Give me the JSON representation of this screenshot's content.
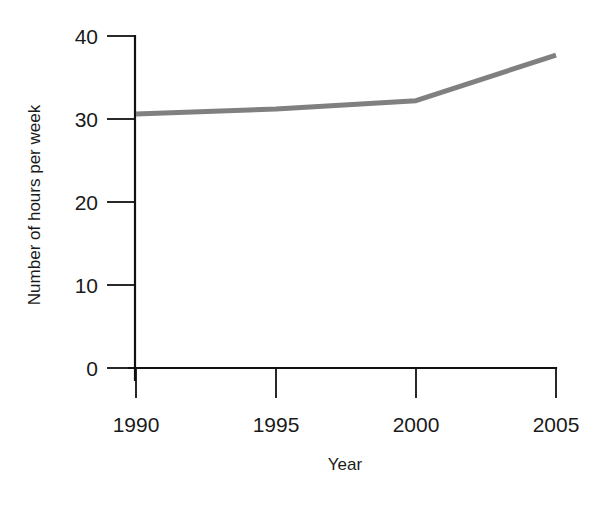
{
  "chart_data": {
    "type": "line",
    "title": "",
    "xlabel": "Year",
    "ylabel": "Number of hours per week",
    "x": [
      1990,
      1995,
      2000,
      2005
    ],
    "values": [
      30.6,
      31.2,
      32.2,
      37.7
    ],
    "series": [
      {
        "name": "Number of hours per week",
        "values": [
          30.6,
          31.2,
          32.2,
          37.7
        ],
        "color": "#808080"
      }
    ],
    "xlim": [
      1990,
      2005
    ],
    "ylim": [
      0,
      40
    ],
    "x_ticks": [
      1990,
      1995,
      2000,
      2005
    ],
    "x_tick_labels": [
      "1990",
      "1995",
      "2000",
      "2005"
    ],
    "y_ticks": [
      0,
      10,
      20,
      30,
      40
    ],
    "y_tick_labels": [
      "0",
      "10",
      "20",
      "30",
      "40"
    ],
    "grid": false,
    "legend": "none",
    "tick_direction": "out",
    "line_color": "#808080",
    "axis_color": "#111111"
  },
  "axes": {
    "y_title": "Number of hours per week",
    "x_title": "Year",
    "y_tick_0": "0",
    "y_tick_1": "10",
    "y_tick_2": "20",
    "y_tick_3": "30",
    "y_tick_4": "40",
    "x_tick_0": "1990",
    "x_tick_1": "1995",
    "x_tick_2": "2000",
    "x_tick_3": "2005"
  }
}
